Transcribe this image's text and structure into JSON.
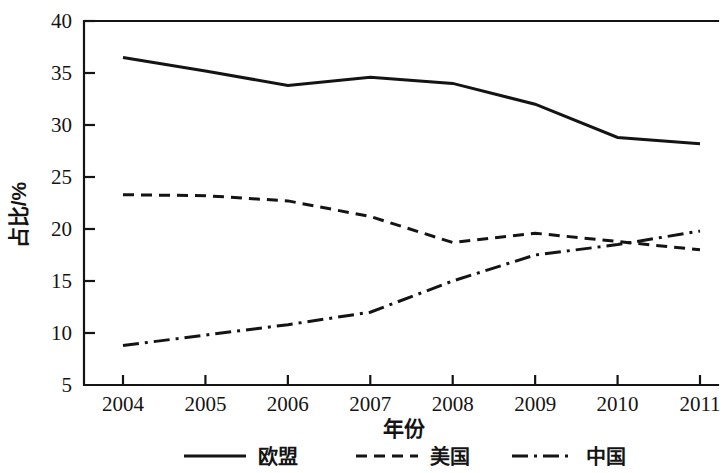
{
  "chart_data": {
    "type": "line",
    "title": "",
    "xlabel": "年份",
    "ylabel": "占比/%",
    "x": [
      2004,
      2005,
      2006,
      2007,
      2008,
      2009,
      2010,
      2011
    ],
    "xtick_labels": [
      "2004",
      "2005",
      "2006",
      "2007",
      "2008",
      "2009",
      "2010",
      "2011"
    ],
    "ytick_labels": [
      "5",
      "10",
      "15",
      "20",
      "25",
      "30",
      "35",
      "40"
    ],
    "ytick_values": [
      5,
      10,
      15,
      20,
      25,
      30,
      35,
      40
    ],
    "xlim": [
      2004,
      2011
    ],
    "ylim": [
      5,
      40
    ],
    "grid": false,
    "legend_position": "bottom",
    "series": [
      {
        "name": "欧盟",
        "linestyle": "solid",
        "color": "#141414",
        "values": [
          36.5,
          35.2,
          33.8,
          34.6,
          34.0,
          32.0,
          28.8,
          28.2
        ]
      },
      {
        "name": "美国",
        "linestyle": "dashed",
        "color": "#141414",
        "values": [
          23.3,
          23.2,
          22.7,
          21.2,
          18.7,
          19.6,
          18.8,
          18.0
        ]
      },
      {
        "name": "中国",
        "linestyle": "dashdot",
        "color": "#141414",
        "values": [
          8.8,
          9.8,
          10.8,
          12.0,
          15.0,
          17.5,
          18.5,
          19.8
        ]
      }
    ]
  },
  "legend": {
    "items": [
      {
        "label": "欧盟",
        "linestyle": "solid"
      },
      {
        "label": "美国",
        "linestyle": "dashed"
      },
      {
        "label": "中国",
        "linestyle": "dashdot"
      }
    ]
  }
}
